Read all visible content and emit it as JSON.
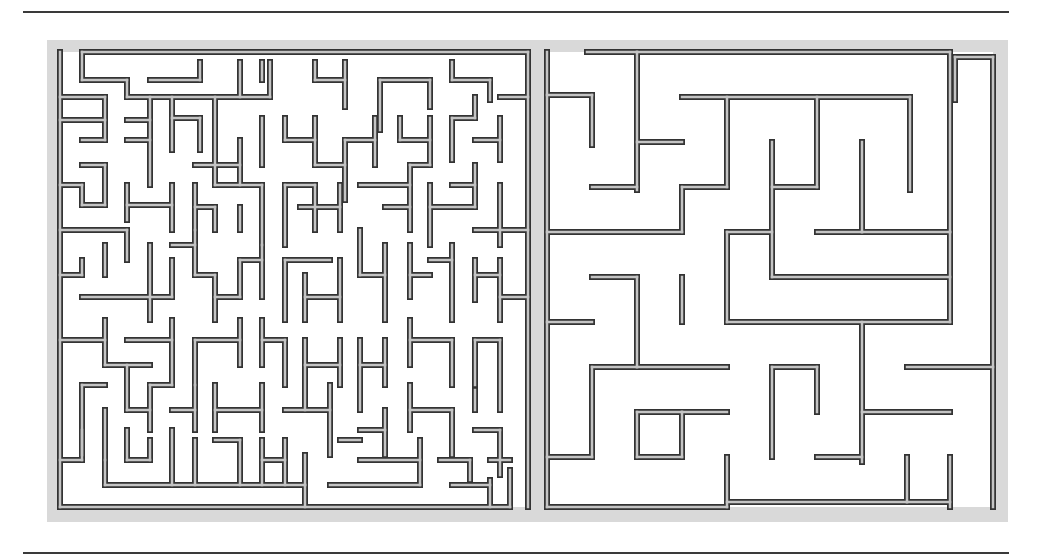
{
  "figure": {
    "colors": {
      "panel": "#d9d9d9",
      "wall_outline": "#333333",
      "wall_fill": "#c4c4c4",
      "rule": "#3a3a3a",
      "background": "#ffffff"
    }
  },
  "rules": {
    "top_y": 11,
    "bottom_y": 552
  },
  "mazes": [
    {
      "name": "left-maze",
      "bounds": {
        "x": 60,
        "y": 52,
        "w": 470,
        "h": 456
      },
      "area": {
        "x": 60,
        "y": 52,
        "w": 470,
        "h": 455
      },
      "walls": [
        [
          60,
          52,
          60,
          507
        ],
        [
          82,
          52,
          528,
          52
        ],
        [
          528,
          52,
          528,
          507
        ],
        [
          60,
          507,
          510,
          507
        ],
        [
          82,
          52,
          82,
          80
        ],
        [
          82,
          80,
          127,
          80
        ],
        [
          127,
          80,
          127,
          97
        ],
        [
          127,
          97,
          270,
          97
        ],
        [
          150,
          80,
          200,
          80
        ],
        [
          200,
          80,
          200,
          62
        ],
        [
          240,
          62,
          240,
          97
        ],
        [
          270,
          62,
          270,
          97
        ],
        [
          262,
          62,
          262,
          80
        ],
        [
          315,
          62,
          315,
          80
        ],
        [
          315,
          80,
          345,
          80
        ],
        [
          345,
          62,
          345,
          107
        ],
        [
          380,
          80,
          430,
          80
        ],
        [
          430,
          80,
          430,
          107
        ],
        [
          380,
          80,
          380,
          130
        ],
        [
          452,
          62,
          452,
          80
        ],
        [
          452,
          80,
          490,
          80
        ],
        [
          490,
          80,
          490,
          100
        ],
        [
          60,
          97,
          105,
          97
        ],
        [
          105,
          97,
          105,
          140
        ],
        [
          60,
          120,
          105,
          120
        ],
        [
          127,
          120,
          150,
          120
        ],
        [
          150,
          97,
          150,
          185
        ],
        [
          150,
          140,
          127,
          140
        ],
        [
          82,
          140,
          105,
          140
        ],
        [
          82,
          165,
          105,
          165
        ],
        [
          105,
          165,
          105,
          205
        ],
        [
          172,
          97,
          172,
          150
        ],
        [
          172,
          118,
          200,
          118
        ],
        [
          200,
          118,
          200,
          150
        ],
        [
          215,
          97,
          215,
          185
        ],
        [
          195,
          165,
          240,
          165
        ],
        [
          240,
          140,
          240,
          185
        ],
        [
          262,
          118,
          262,
          165
        ],
        [
          285,
          118,
          285,
          140
        ],
        [
          285,
          140,
          315,
          140
        ],
        [
          315,
          118,
          315,
          165
        ],
        [
          315,
          165,
          345,
          165
        ],
        [
          345,
          140,
          345,
          200
        ],
        [
          345,
          140,
          375,
          140
        ],
        [
          375,
          118,
          375,
          165
        ],
        [
          400,
          118,
          400,
          140
        ],
        [
          400,
          140,
          430,
          140
        ],
        [
          430,
          118,
          430,
          165
        ],
        [
          430,
          165,
          410,
          165
        ],
        [
          452,
          118,
          452,
          160
        ],
        [
          452,
          118,
          475,
          118
        ],
        [
          475,
          97,
          475,
          118
        ],
        [
          500,
          118,
          500,
          160
        ],
        [
          475,
          140,
          500,
          140
        ],
        [
          500,
          97,
          528,
          97
        ],
        [
          60,
          185,
          82,
          185
        ],
        [
          82,
          185,
          82,
          205
        ],
        [
          82,
          205,
          105,
          205
        ],
        [
          127,
          185,
          127,
          220
        ],
        [
          127,
          205,
          172,
          205
        ],
        [
          172,
          185,
          172,
          230
        ],
        [
          195,
          185,
          195,
          230
        ],
        [
          195,
          207,
          215,
          207
        ],
        [
          215,
          207,
          215,
          230
        ],
        [
          215,
          185,
          262,
          185
        ],
        [
          262,
          185,
          262,
          245
        ],
        [
          240,
          207,
          240,
          230
        ],
        [
          285,
          185,
          285,
          245
        ],
        [
          285,
          185,
          315,
          185
        ],
        [
          315,
          185,
          315,
          230
        ],
        [
          300,
          207,
          340,
          207
        ],
        [
          340,
          185,
          340,
          230
        ],
        [
          360,
          185,
          410,
          185
        ],
        [
          410,
          165,
          410,
          230
        ],
        [
          385,
          207,
          410,
          207
        ],
        [
          430,
          185,
          430,
          245
        ],
        [
          430,
          207,
          475,
          207
        ],
        [
          452,
          185,
          475,
          185
        ],
        [
          475,
          165,
          475,
          207
        ],
        [
          500,
          185,
          500,
          245
        ],
        [
          475,
          230,
          528,
          230
        ],
        [
          60,
          230,
          127,
          230
        ],
        [
          127,
          230,
          127,
          260
        ],
        [
          105,
          245,
          105,
          275
        ],
        [
          82,
          260,
          82,
          275
        ],
        [
          60,
          275,
          82,
          275
        ],
        [
          82,
          297,
          172,
          297
        ],
        [
          150,
          245,
          150,
          320
        ],
        [
          172,
          260,
          172,
          297
        ],
        [
          172,
          245,
          195,
          245
        ],
        [
          195,
          230,
          195,
          275
        ],
        [
          195,
          275,
          215,
          275
        ],
        [
          215,
          275,
          215,
          320
        ],
        [
          215,
          297,
          240,
          297
        ],
        [
          240,
          260,
          240,
          297
        ],
        [
          240,
          260,
          262,
          260
        ],
        [
          262,
          245,
          262,
          297
        ],
        [
          285,
          260,
          330,
          260
        ],
        [
          285,
          260,
          285,
          320
        ],
        [
          305,
          275,
          305,
          320
        ],
        [
          305,
          297,
          340,
          297
        ],
        [
          340,
          260,
          340,
          320
        ],
        [
          360,
          230,
          360,
          275
        ],
        [
          360,
          275,
          385,
          275
        ],
        [
          385,
          245,
          385,
          320
        ],
        [
          410,
          245,
          410,
          297
        ],
        [
          410,
          275,
          430,
          275
        ],
        [
          430,
          260,
          452,
          260
        ],
        [
          452,
          245,
          452,
          320
        ],
        [
          475,
          260,
          475,
          300
        ],
        [
          475,
          275,
          500,
          275
        ],
        [
          500,
          260,
          500,
          320
        ],
        [
          500,
          297,
          528,
          297
        ],
        [
          60,
          340,
          105,
          340
        ],
        [
          105,
          320,
          105,
          365
        ],
        [
          105,
          365,
          150,
          365
        ],
        [
          127,
          340,
          172,
          340
        ],
        [
          172,
          320,
          172,
          385
        ],
        [
          195,
          340,
          195,
          385
        ],
        [
          195,
          340,
          240,
          340
        ],
        [
          240,
          320,
          240,
          365
        ],
        [
          262,
          320,
          262,
          365
        ],
        [
          262,
          340,
          285,
          340
        ],
        [
          285,
          340,
          285,
          385
        ],
        [
          305,
          340,
          305,
          410
        ],
        [
          305,
          365,
          340,
          365
        ],
        [
          340,
          340,
          340,
          385
        ],
        [
          360,
          340,
          360,
          410
        ],
        [
          360,
          365,
          385,
          365
        ],
        [
          385,
          340,
          385,
          385
        ],
        [
          410,
          320,
          410,
          365
        ],
        [
          410,
          340,
          452,
          340
        ],
        [
          452,
          340,
          452,
          385
        ],
        [
          475,
          340,
          475,
          385
        ],
        [
          475,
          340,
          500,
          340
        ],
        [
          500,
          340,
          500,
          410
        ],
        [
          82,
          385,
          82,
          455
        ],
        [
          82,
          385,
          105,
          385
        ],
        [
          105,
          410,
          105,
          460
        ],
        [
          127,
          365,
          127,
          410
        ],
        [
          127,
          410,
          150,
          410
        ],
        [
          150,
          385,
          150,
          430
        ],
        [
          150,
          385,
          172,
          385
        ],
        [
          172,
          410,
          195,
          410
        ],
        [
          195,
          385,
          195,
          430
        ],
        [
          215,
          385,
          215,
          430
        ],
        [
          215,
          410,
          262,
          410
        ],
        [
          262,
          385,
          262,
          430
        ],
        [
          285,
          410,
          330,
          410
        ],
        [
          330,
          385,
          330,
          455
        ],
        [
          360,
          430,
          385,
          430
        ],
        [
          385,
          410,
          385,
          455
        ],
        [
          410,
          385,
          410,
          430
        ],
        [
          410,
          410,
          452,
          410
        ],
        [
          452,
          410,
          452,
          455
        ],
        [
          475,
          430,
          500,
          430
        ],
        [
          500,
          430,
          500,
          475
        ],
        [
          475,
          390,
          475,
          410
        ],
        [
          60,
          460,
          82,
          460
        ],
        [
          82,
          430,
          82,
          460
        ],
        [
          105,
          460,
          105,
          485
        ],
        [
          105,
          485,
          305,
          485
        ],
        [
          127,
          430,
          127,
          460
        ],
        [
          127,
          460,
          150,
          460
        ],
        [
          150,
          440,
          150,
          460
        ],
        [
          172,
          430,
          172,
          485
        ],
        [
          195,
          440,
          195,
          485
        ],
        [
          215,
          440,
          240,
          440
        ],
        [
          240,
          440,
          240,
          485
        ],
        [
          262,
          440,
          262,
          485
        ],
        [
          262,
          460,
          285,
          460
        ],
        [
          285,
          440,
          285,
          485
        ],
        [
          305,
          455,
          305,
          485
        ],
        [
          305,
          507,
          305,
          485
        ],
        [
          330,
          485,
          420,
          485
        ],
        [
          360,
          460,
          420,
          460
        ],
        [
          340,
          440,
          360,
          440
        ],
        [
          420,
          440,
          420,
          485
        ],
        [
          440,
          460,
          470,
          460
        ],
        [
          470,
          460,
          470,
          480
        ],
        [
          490,
          480,
          490,
          507
        ],
        [
          510,
          470,
          510,
          507
        ],
        [
          452,
          485,
          490,
          485
        ],
        [
          490,
          460,
          510,
          460
        ]
      ]
    },
    {
      "name": "right-maze",
      "bounds": {
        "x": 547,
        "y": 52,
        "w": 446,
        "h": 456
      },
      "area": {
        "x": 547,
        "y": 52,
        "w": 446,
        "h": 455
      },
      "walls": [
        [
          547,
          52,
          547,
          507
        ],
        [
          587,
          52,
          637,
          52
        ],
        [
          637,
          52,
          637,
          190
        ],
        [
          637,
          52,
          950,
          52
        ],
        [
          950,
          52,
          950,
          232
        ],
        [
          955,
          57,
          993,
          57
        ],
        [
          993,
          57,
          993,
          507
        ],
        [
          955,
          57,
          955,
          100
        ],
        [
          547,
          95,
          592,
          95
        ],
        [
          592,
          95,
          592,
          145
        ],
        [
          637,
          142,
          682,
          142
        ],
        [
          592,
          187,
          637,
          187
        ],
        [
          682,
          97,
          910,
          97
        ],
        [
          910,
          97,
          910,
          190
        ],
        [
          727,
          97,
          727,
          187
        ],
        [
          727,
          187,
          682,
          187
        ],
        [
          682,
          187,
          682,
          232
        ],
        [
          547,
          232,
          682,
          232
        ],
        [
          817,
          97,
          817,
          187
        ],
        [
          817,
          187,
          772,
          187
        ],
        [
          772,
          142,
          772,
          277
        ],
        [
          862,
          142,
          862,
          232
        ],
        [
          862,
          232,
          817,
          232
        ],
        [
          727,
          232,
          772,
          232
        ],
        [
          950,
          232,
          950,
          322
        ],
        [
          950,
          232,
          862,
          232
        ],
        [
          772,
          277,
          950,
          277
        ],
        [
          727,
          232,
          727,
          322
        ],
        [
          727,
          322,
          950,
          322
        ],
        [
          592,
          277,
          637,
          277
        ],
        [
          637,
          277,
          637,
          367
        ],
        [
          547,
          322,
          592,
          322
        ],
        [
          637,
          367,
          727,
          367
        ],
        [
          592,
          367,
          592,
          457
        ],
        [
          592,
          367,
          637,
          367
        ],
        [
          682,
          277,
          682,
          322
        ],
        [
          592,
          457,
          547,
          457
        ],
        [
          637,
          412,
          682,
          412
        ],
        [
          682,
          412,
          682,
          457
        ],
        [
          637,
          457,
          682,
          457
        ],
        [
          637,
          412,
          637,
          457
        ],
        [
          682,
          412,
          727,
          412
        ],
        [
          772,
          367,
          772,
          457
        ],
        [
          772,
          367,
          817,
          367
        ],
        [
          817,
          367,
          817,
          412
        ],
        [
          862,
          322,
          862,
          462
        ],
        [
          862,
          412,
          950,
          412
        ],
        [
          862,
          457,
          817,
          457
        ],
        [
          907,
          367,
          993,
          367
        ],
        [
          547,
          507,
          727,
          507
        ],
        [
          727,
          457,
          727,
          507
        ],
        [
          727,
          502,
          907,
          502
        ],
        [
          907,
          457,
          907,
          502
        ],
        [
          907,
          502,
          950,
          502
        ],
        [
          950,
          457,
          950,
          507
        ]
      ]
    }
  ]
}
